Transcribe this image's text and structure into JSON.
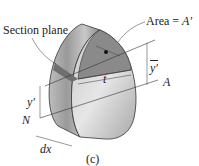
{
  "figure": {
    "labels": {
      "section_plane": "Section plane",
      "area": "Area = ",
      "area_symbol": "A′",
      "t": "t",
      "ybar": "y′",
      "y_prime": "y′",
      "A": "A",
      "N": "N",
      "dx": "dx",
      "caption": "(c)"
    },
    "colors": {
      "body_light": "#d8d8d8",
      "body_dark": "#7a7a7a",
      "section_fill": "#8a8a8a",
      "line": "#333333"
    }
  }
}
